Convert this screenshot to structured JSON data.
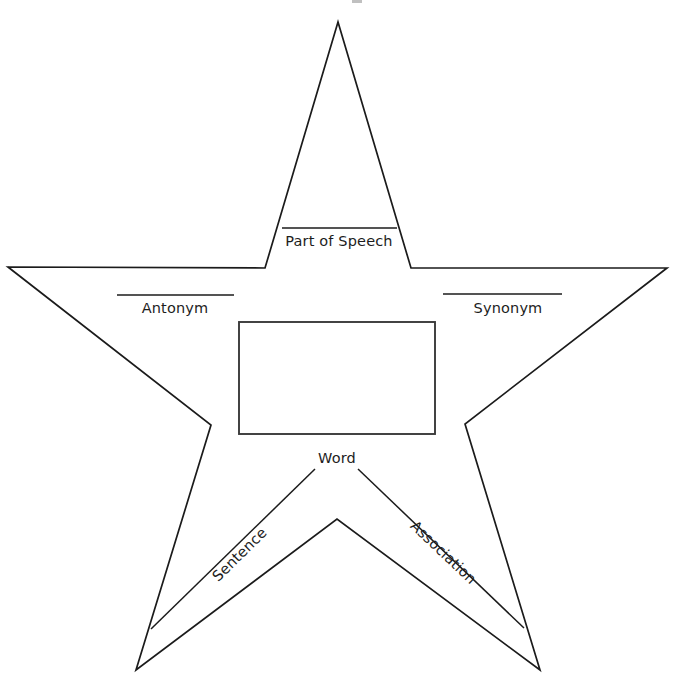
{
  "worksheet": {
    "title": "Vocabulary Word Star Graphic Organizer",
    "shape": "five-pointed-star",
    "background_color": "#ffffff",
    "line_color": "#1b1b1b",
    "text_color": "#1d1d1d"
  },
  "labels": {
    "part_of_speech": "Part of Speech",
    "antonym": "Antonym",
    "synonym": "Synonym",
    "word": "Word",
    "sentence": "Sentence",
    "association": "Association"
  },
  "fields": {
    "part_of_speech_value": "",
    "antonym_value": "",
    "synonym_value": "",
    "word_value": "",
    "sentence_value": "",
    "association_value": ""
  },
  "geometry": {
    "star_points": "338,22 265,268 8,267 211,425 136,670 337,519 540,670 465,424 667,268 411,268",
    "word_box": {
      "x": 239,
      "y": 322,
      "width": 196,
      "height": 112
    },
    "rule_lines": [
      {
        "name": "part-of-speech-rule",
        "x1": 282,
        "y1": 228,
        "x2": 397,
        "y2": 228
      },
      {
        "name": "antonym-rule",
        "x1": 117,
        "y1": 295,
        "x2": 234,
        "y2": 295
      },
      {
        "name": "synonym-rule",
        "x1": 443,
        "y1": 294,
        "x2": 562,
        "y2": 294
      },
      {
        "name": "sentence-rule",
        "x1": 151,
        "y1": 629,
        "x2": 315,
        "y2": 469
      },
      {
        "name": "association-rule",
        "x1": 358,
        "y1": 469,
        "x2": 524,
        "y2": 628
      }
    ]
  }
}
